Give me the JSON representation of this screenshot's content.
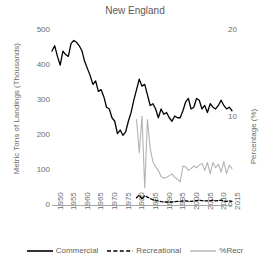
{
  "chart_data": {
    "type": "line",
    "title": "New England",
    "xlabel": "",
    "ylabel": "Metric Tons of Landings (Thousands)",
    "y2label": "Percentage (%)",
    "xlim": [
      1950,
      2016
    ],
    "ylim": [
      0,
      500
    ],
    "y2lim": [
      0,
      20
    ],
    "yticks": [
      0,
      100,
      200,
      300,
      400,
      500
    ],
    "y2ticks": [
      0,
      10,
      20
    ],
    "xticks": [
      1950,
      1955,
      1960,
      1965,
      1970,
      1975,
      1980,
      1985,
      1990,
      1995,
      2000,
      2005,
      2010,
      2015
    ],
    "grid": false,
    "legend_position": "bottom",
    "series": [
      {
        "name": "Commercial",
        "axis": "left",
        "style": "solid",
        "color": "#000000",
        "x": [
          1950,
          1951,
          1952,
          1953,
          1954,
          1955,
          1956,
          1957,
          1958,
          1959,
          1960,
          1961,
          1962,
          1963,
          1964,
          1965,
          1966,
          1967,
          1968,
          1969,
          1970,
          1971,
          1972,
          1973,
          1974,
          1975,
          1976,
          1977,
          1978,
          1979,
          1980,
          1981,
          1982,
          1983,
          1984,
          1985,
          1986,
          1987,
          1988,
          1989,
          1990,
          1991,
          1992,
          1993,
          1994,
          1995,
          1996,
          1997,
          1998,
          1999,
          2000,
          2001,
          2002,
          2003,
          2004,
          2005,
          2006,
          2007,
          2008,
          2009,
          2010,
          2011,
          2012,
          2013,
          2014,
          2015,
          2016
        ],
        "values": [
          440,
          455,
          425,
          400,
          440,
          430,
          425,
          462,
          470,
          465,
          455,
          440,
          410,
          390,
          370,
          345,
          355,
          325,
          330,
          310,
          280,
          275,
          250,
          240,
          205,
          215,
          200,
          210,
          240,
          265,
          300,
          330,
          360,
          340,
          345,
          315,
          285,
          290,
          275,
          250,
          275,
          260,
          265,
          250,
          240,
          255,
          250,
          250,
          270,
          295,
          305,
          275,
          280,
          305,
          300,
          275,
          285,
          265,
          290,
          280,
          275,
          285,
          300,
          285,
          275,
          280,
          270
        ]
      },
      {
        "name": "Recreational",
        "axis": "left",
        "style": "dashed",
        "color": "#000000",
        "x": [
          1981,
          1982,
          1983,
          1984,
          1985,
          1986,
          1987,
          1988,
          1989,
          1990,
          1991,
          1992,
          1993,
          1994,
          1995,
          1996,
          1997,
          1998,
          1999,
          2000,
          2001,
          2002,
          2003,
          2004,
          2005,
          2006,
          2007,
          2008,
          2009,
          2010,
          2011,
          2012,
          2013,
          2014,
          2015,
          2016
        ],
        "values": [
          22,
          30,
          18,
          28,
          24,
          20,
          16,
          14,
          13,
          11,
          10,
          10,
          10,
          10,
          11,
          12,
          12,
          13,
          13,
          12,
          12,
          13,
          14,
          15,
          14,
          13,
          13,
          14,
          15,
          13,
          14,
          15,
          13,
          12,
          13,
          12
        ]
      },
      {
        "name": "%Recr",
        "axis": "right",
        "style": "solid",
        "color": "#b3b3b3",
        "x": [
          1981,
          1982,
          1983,
          1984,
          1985,
          1986,
          1987,
          1988,
          1989,
          1990,
          1991,
          1992,
          1993,
          1994,
          1995,
          1996,
          1997,
          1998,
          1999,
          2000,
          2001,
          2002,
          2003,
          2004,
          2005,
          2006,
          2007,
          2008,
          2009,
          2010,
          2011,
          2012,
          2013,
          2014,
          2015,
          2016
        ],
        "values": [
          9.8,
          6.0,
          10.2,
          2.0,
          9.8,
          6.5,
          5.0,
          4.4,
          4.0,
          3.3,
          3.1,
          3.2,
          3.4,
          3.6,
          3.2,
          3.0,
          2.7,
          4.5,
          4.4,
          4.0,
          4.2,
          4.5,
          4.3,
          4.6,
          4.8,
          4.0,
          4.9,
          3.6,
          4.9,
          4.3,
          4.7,
          3.8,
          5.0,
          3.6,
          4.6,
          4.2
        ]
      }
    ]
  },
  "legend": {
    "items": [
      {
        "label": "Commercial"
      },
      {
        "label": "Recreational"
      },
      {
        "label": "%Recr"
      }
    ]
  }
}
